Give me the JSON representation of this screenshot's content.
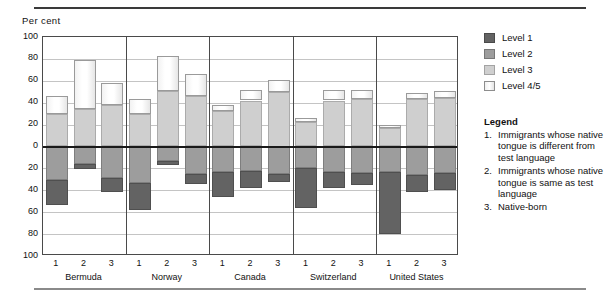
{
  "axis_unit_label": "Per cent",
  "yaxis": {
    "ticks": [
      "100",
      "80",
      "60",
      "40",
      "20",
      "0",
      "20",
      "40",
      "60",
      "80",
      "100"
    ],
    "top": 100,
    "bottom": -100,
    "step": 20
  },
  "legend": {
    "keys": [
      {
        "label": "Level 1",
        "color": "#636363"
      },
      {
        "label": "Level 2",
        "color": "#9d9d9d"
      },
      {
        "label": "Level 3",
        "color": "#cfcfcf"
      },
      {
        "label": "Level 4/5",
        "color": "#ffffff"
      }
    ],
    "title": "Legend",
    "notes": [
      {
        "num": "1.",
        "text": "Immigrants whose native tongue is different from test language"
      },
      {
        "num": "2.",
        "text": "Immigrants whose native tongue is same as test language"
      },
      {
        "num": "3.",
        "text": "Native-born"
      }
    ]
  },
  "chart_data": {
    "type": "bar",
    "title": "",
    "xlabel": "",
    "ylabel": "Per cent",
    "ylim": [
      -100,
      100
    ],
    "grid": true,
    "legend_position": "right",
    "stacked": true,
    "diverging": true,
    "note": "Levels 3 and 4/5 stack upward (positive); Levels 2 and 1 stack downward (negative).",
    "groups": [
      "Bermuda",
      "Norway",
      "Canada",
      "Switzerland",
      "United States"
    ],
    "subcategories": [
      "1",
      "2",
      "3"
    ],
    "categories": [
      "Bermuda 1",
      "Bermuda 2",
      "Bermuda 3",
      "Norway 1",
      "Norway 2",
      "Norway 3",
      "Canada 1",
      "Canada 2",
      "Canada 3",
      "Switzerland 1",
      "Switzerland 2",
      "Switzerland 3",
      "United States 1",
      "United States 2",
      "United States 3"
    ],
    "series": [
      {
        "name": "Level 3",
        "direction": "up",
        "values": [
          30,
          34,
          38,
          30,
          51,
          46,
          32,
          42,
          50,
          22,
          42,
          43,
          17,
          43,
          44
        ]
      },
      {
        "name": "Level 4/5",
        "direction": "up",
        "values": [
          16,
          45,
          20,
          13,
          32,
          20,
          6,
          10,
          11,
          4,
          10,
          9,
          3,
          6,
          7
        ]
      },
      {
        "name": "Level 2",
        "direction": "down",
        "values": [
          31,
          16,
          29,
          33,
          13,
          25,
          23,
          22,
          25,
          20,
          23,
          24,
          23,
          26,
          24
        ]
      },
      {
        "name": "Level 1",
        "direction": "down",
        "values": [
          22,
          5,
          13,
          25,
          4,
          9,
          23,
          16,
          7,
          36,
          15,
          11,
          57,
          16,
          16
        ]
      }
    ],
    "totals_positive": [
      46,
      79,
      58,
      43,
      83,
      66,
      38,
      52,
      61,
      26,
      52,
      52,
      20,
      49,
      51
    ],
    "totals_negative": [
      -53,
      -21,
      -42,
      -58,
      -17,
      -34,
      -46,
      -38,
      -32,
      -56,
      -38,
      -35,
      -80,
      -42,
      -40
    ]
  }
}
